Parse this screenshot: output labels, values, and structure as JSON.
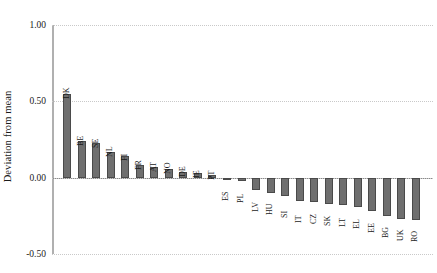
{
  "chart_data": {
    "type": "bar",
    "title": "",
    "subtitle": "",
    "xlabel": "",
    "ylabel": "Deviation from mean",
    "ylim": [
      -0.5,
      1.0
    ],
    "yticks": [
      "1.00",
      "0.50",
      "0.00",
      "-0.50"
    ],
    "ytick_values": [
      1.0,
      0.5,
      0.0,
      -0.5
    ],
    "grid": "horizontal-dotted",
    "legend": "none",
    "categories": [
      "DK",
      "BE",
      "SE",
      "NL",
      "FI",
      "FR",
      "AT",
      "NO",
      "DE",
      "IE",
      "PT",
      "ES",
      "PL",
      "LV",
      "HU",
      "SI",
      "IT",
      "CZ",
      "SK",
      "LT",
      "EL",
      "EE",
      "BG",
      "UK",
      "RO"
    ],
    "values": [
      0.55,
      0.24,
      0.23,
      0.17,
      0.14,
      0.08,
      0.07,
      0.06,
      0.04,
      0.03,
      0.02,
      -0.01,
      -0.02,
      -0.08,
      -0.1,
      -0.12,
      -0.15,
      -0.16,
      -0.17,
      -0.18,
      -0.19,
      -0.22,
      -0.25,
      -0.27,
      -0.28
    ]
  },
  "style": {
    "bar_fill": "#6f6f6f",
    "bar_edge": "#4a4a4a",
    "grid_color": "#c9c9c9",
    "axis_color": "#b0b0b0",
    "zero_line_color": "#8a8a8a",
    "text_color": "#1a1a1a",
    "background": "#ffffff"
  }
}
